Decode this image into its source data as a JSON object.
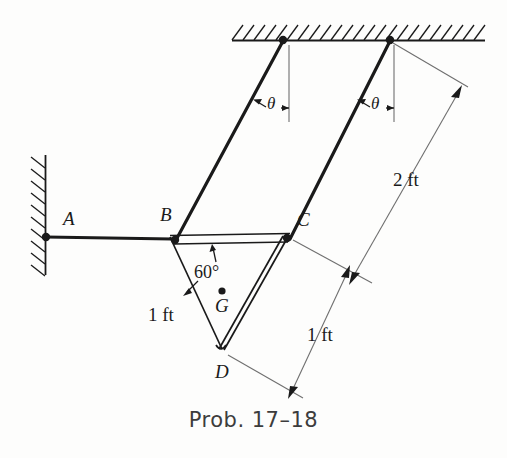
{
  "figure": {
    "caption": "Prob. 17–18",
    "background_color": "#fdfdfc",
    "ink_color": "#1a1a1a",
    "thin_line_color": "#7a7a7a"
  },
  "points": {
    "A": {
      "label": "A",
      "desc": "pin support at wall",
      "x": 46,
      "y": 237
    },
    "B": {
      "label": "B",
      "desc": "pin joint left of plate",
      "x": 172,
      "y": 239
    },
    "C": {
      "label": "C",
      "desc": "pin joint right of plate",
      "x": 288,
      "y": 237
    },
    "D": {
      "label": "D",
      "desc": "lower vertex of triangular plate",
      "x": 222,
      "y": 349
    },
    "G": {
      "label": "G",
      "desc": "center of mass of plate",
      "x": 222,
      "y": 291
    },
    "pin_left": {
      "label": "",
      "desc": "ceiling pin for left rod",
      "x": 283,
      "y": 40
    },
    "pin_right": {
      "label": "",
      "desc": "ceiling pin for right rod",
      "x": 390,
      "y": 40
    }
  },
  "angles": {
    "theta_left": "θ",
    "theta_right": "θ",
    "plate_apex": "60°"
  },
  "dimensions": {
    "rod_length": "2 ft",
    "plate_side": "1 ft",
    "plate_side_right": "1 ft"
  },
  "supports": {
    "wall": "fixed vertical wall with hatching",
    "ceiling": "fixed horizontal ceiling with hatching"
  }
}
